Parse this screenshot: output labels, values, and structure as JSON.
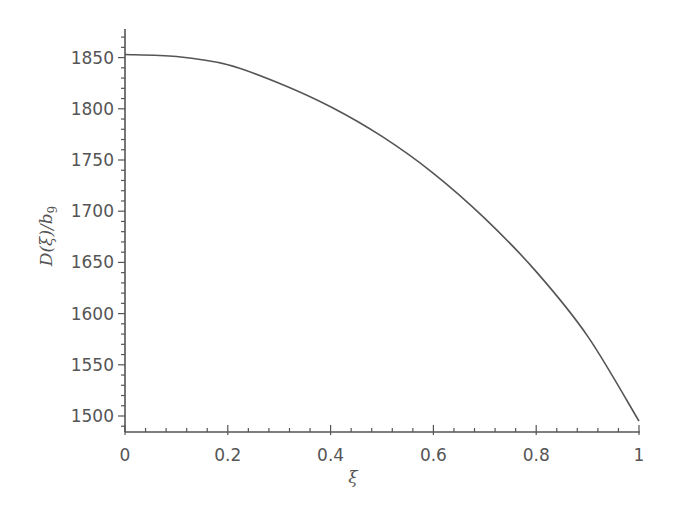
{
  "chart_data": {
    "type": "line",
    "title": "",
    "xlabel": "ξ",
    "ylabel": "D(ξ)/b₉",
    "ylabel_parts": {
      "main": "D(ξ)/b",
      "sub": "9"
    },
    "xlim": [
      0,
      1
    ],
    "ylim": [
      1485,
      1880
    ],
    "grid": false,
    "legend": null,
    "x_ticks": [
      "0",
      "0.2",
      "0.4",
      "0.6",
      "0.8",
      "1"
    ],
    "x_tick_values": [
      0,
      0.2,
      0.4,
      0.6,
      0.8,
      1
    ],
    "y_ticks": [
      "1500",
      "1550",
      "1600",
      "1650",
      "1700",
      "1750",
      "1800",
      "1850"
    ],
    "y_tick_values": [
      1500,
      1550,
      1600,
      1650,
      1700,
      1750,
      1800,
      1850
    ],
    "series": [
      {
        "name": "D(ξ)/b9",
        "color": "#555555",
        "x": [
          0,
          0.1,
          0.2,
          0.3,
          0.4,
          0.5,
          0.6,
          0.7,
          0.8,
          0.9,
          1.0
        ],
        "values": [
          1853,
          1851,
          1843,
          1825,
          1802,
          1773,
          1737,
          1693,
          1641,
          1578,
          1495
        ]
      }
    ]
  },
  "colors": {
    "axis": "#555555",
    "text": "#555555",
    "line": "#555555",
    "background": "#ffffff"
  }
}
